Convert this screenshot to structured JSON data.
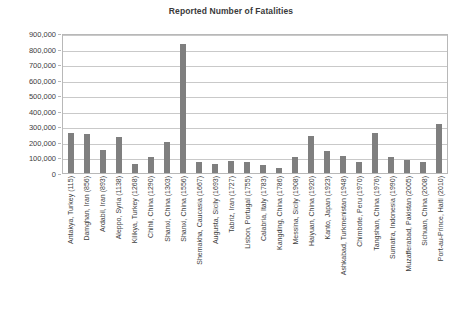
{
  "chart_data": {
    "type": "bar",
    "title": "Reported Number of Fatalities",
    "xlabel": "",
    "ylabel": "",
    "ylim": [
      0,
      900000
    ],
    "ytick_labels": [
      "900,000",
      "800,000",
      "700,000",
      "600,000",
      "500,000",
      "400,000",
      "300,000",
      "200,000",
      "100,000",
      "0"
    ],
    "ytick_values": [
      900000,
      800000,
      700000,
      600000,
      500000,
      400000,
      300000,
      200000,
      100000,
      0
    ],
    "grid": true,
    "legend": "none",
    "bar_color": "#7f7f7f",
    "categories": [
      "Antakya, Turkey (115)",
      "Damghan, Iran (856)",
      "Ardabil, Iran (893)",
      "Aleppo, Syria (1138)",
      "Kilikya, Turkey (1268)",
      "Chihli, China (1290)",
      "Shanxi, China (1303)",
      "Shanxi, China (1556)",
      "Shemakha, Caucasia (1667)",
      "Augusta, Sicily (1693)",
      "Tabriz, Iran (1727)",
      "Lisbon, Portugal (1755)",
      "Calabria, Italy (1783)",
      "Kangding, China (1786)",
      "Messina, Sicily (1908)",
      "Haiyuan, China (1920)",
      "Kanto, Japan (1923)",
      "Ashkabad, Turkmenistan (1948)",
      "Chimbote, Peru (1970)",
      "Tangshan, China (1976)",
      "Sumatra, Indonesia (1990)",
      "Muzafferabad, Pakistan (2005)",
      "Sichuan, China (2008)",
      "Port-au-Prince, Haiti (2010)"
    ],
    "values": [
      260000,
      250000,
      150000,
      230000,
      60000,
      100000,
      200000,
      830000,
      70000,
      60000,
      77000,
      70000,
      50000,
      30000,
      100000,
      235000,
      143000,
      110000,
      70000,
      255000,
      100000,
      86000,
      68000,
      316000
    ]
  }
}
